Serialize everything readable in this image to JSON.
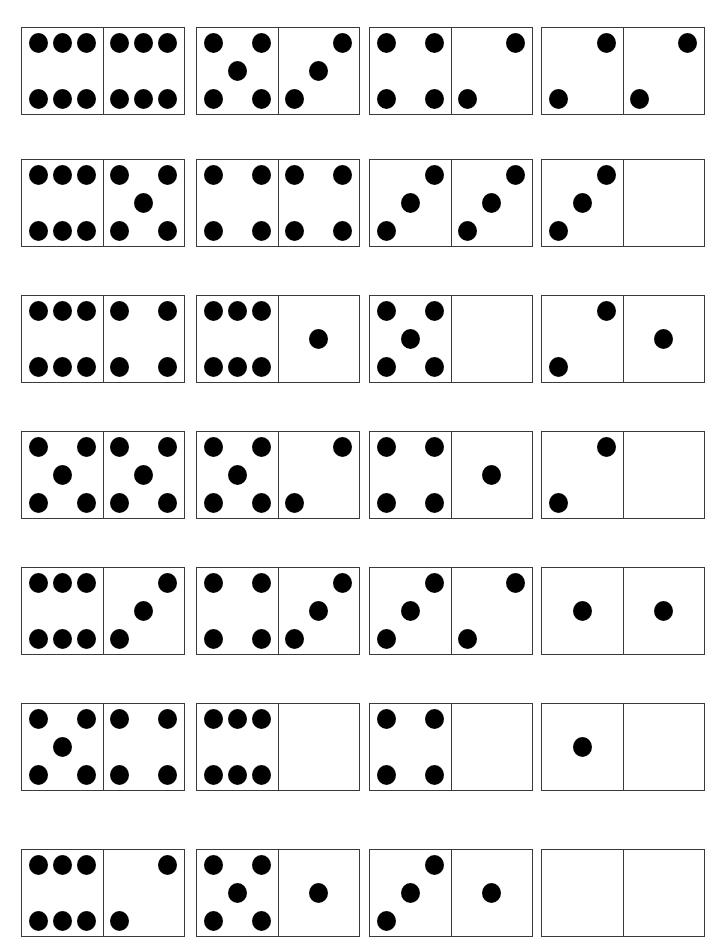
{
  "worksheet": {
    "layout": {
      "columns": 4,
      "rows": 7
    },
    "colors": {
      "pip": "#000000",
      "border": "#3a3a3a",
      "background": "#ffffff"
    },
    "rows": [
      {
        "y": 27,
        "dominoes": [
          {
            "left": 6,
            "right": 6
          },
          {
            "left": 5,
            "right": 3
          },
          {
            "left": 4,
            "right": 2
          },
          {
            "left": 2,
            "right": 2
          }
        ]
      },
      {
        "y": 159,
        "dominoes": [
          {
            "left": 6,
            "right": 5
          },
          {
            "left": 4,
            "right": 4
          },
          {
            "left": 3,
            "right": 3
          },
          {
            "left": 3,
            "right": 0
          }
        ]
      },
      {
        "y": 295,
        "dominoes": [
          {
            "left": 6,
            "right": 4
          },
          {
            "left": 6,
            "right": 1
          },
          {
            "left": 5,
            "right": 0
          },
          {
            "left": 2,
            "right": 1
          }
        ]
      },
      {
        "y": 431,
        "dominoes": [
          {
            "left": 5,
            "right": 5
          },
          {
            "left": 5,
            "right": 2
          },
          {
            "left": 4,
            "right": 1
          },
          {
            "left": 2,
            "right": 0
          }
        ]
      },
      {
        "y": 567,
        "dominoes": [
          {
            "left": 6,
            "right": 3
          },
          {
            "left": 4,
            "right": 3
          },
          {
            "left": 3,
            "right": 2
          },
          {
            "left": 1,
            "right": 1
          }
        ]
      },
      {
        "y": 703,
        "dominoes": [
          {
            "left": 5,
            "right": 4
          },
          {
            "left": 6,
            "right": 0
          },
          {
            "left": 4,
            "right": 0
          },
          {
            "left": 1,
            "right": 0
          }
        ]
      },
      {
        "y": 849,
        "dominoes": [
          {
            "left": 6,
            "right": 2
          },
          {
            "left": 5,
            "right": 1
          },
          {
            "left": 3,
            "right": 1
          },
          {
            "left": 0,
            "right": 0
          }
        ]
      }
    ],
    "column_x": [
      21,
      196,
      369,
      541
    ]
  }
}
